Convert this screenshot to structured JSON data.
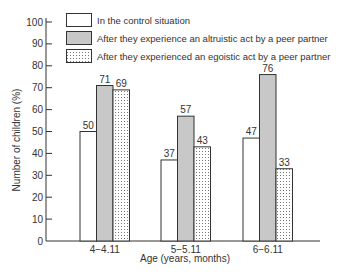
{
  "chart_data": {
    "type": "bar",
    "title": "",
    "xlabel": "Age (years, months)",
    "ylabel": "Number of children (%)",
    "ylim": [
      0,
      100
    ],
    "yticks": [
      0,
      10,
      20,
      30,
      40,
      50,
      60,
      70,
      80,
      90,
      100
    ],
    "grid": false,
    "legend_position": "top-left inside",
    "categories": [
      "4−4.11",
      "5−5.11",
      "6−6.11"
    ],
    "series": [
      {
        "name": "In the control situation",
        "values": [
          50,
          37,
          47
        ],
        "fill": "#ffffff",
        "pattern": "none"
      },
      {
        "name": "After they experience an altruistic act by a peer partner",
        "values": [
          71,
          57,
          76
        ],
        "fill": "#c8c8c8",
        "pattern": "none"
      },
      {
        "name": "After they experienced an egoistic act by a peer partner",
        "values": [
          69,
          43,
          33
        ],
        "fill": "#ffffff",
        "pattern": "dotted"
      }
    ]
  },
  "colors": {
    "axis": "#333333",
    "gray_fill": "#c8c8c8",
    "dot": "#777777"
  }
}
